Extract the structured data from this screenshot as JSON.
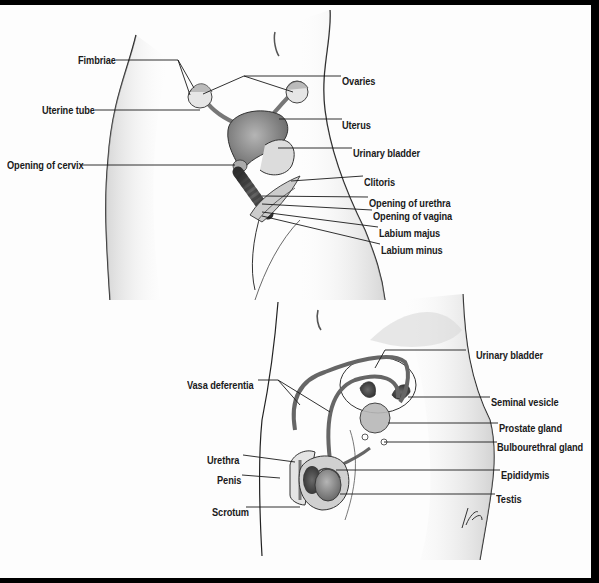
{
  "diagram": {
    "type": "anatomical-illustration",
    "panels": [
      {
        "id": "female",
        "labels": [
          {
            "text": "Fimbriae",
            "side": "left"
          },
          {
            "text": "Uterine tube",
            "side": "left"
          },
          {
            "text": "Opening of cervix",
            "side": "left"
          },
          {
            "text": "Ovaries",
            "side": "right"
          },
          {
            "text": "Uterus",
            "side": "right"
          },
          {
            "text": "Urinary bladder",
            "side": "right"
          },
          {
            "text": "Clitoris",
            "side": "right"
          },
          {
            "text": "Opening of urethra",
            "side": "right"
          },
          {
            "text": "Opening of vagina",
            "side": "right"
          },
          {
            "text": "Labium majus",
            "side": "right"
          },
          {
            "text": "Labium minus",
            "side": "right"
          }
        ]
      },
      {
        "id": "male",
        "labels": [
          {
            "text": "Vasa deferentia",
            "side": "left"
          },
          {
            "text": "Urethra",
            "side": "left"
          },
          {
            "text": "Penis",
            "side": "left"
          },
          {
            "text": "Scrotum",
            "side": "left"
          },
          {
            "text": "Urinary bladder",
            "side": "right"
          },
          {
            "text": "Seminal vesicle",
            "side": "right"
          },
          {
            "text": "Prostate gland",
            "side": "right"
          },
          {
            "text": "Bulbourethral gland",
            "side": "right"
          },
          {
            "text": "Epididymis",
            "side": "right"
          },
          {
            "text": "Testis",
            "side": "right"
          }
        ]
      }
    ]
  },
  "colors": {
    "frame": "#000000",
    "background": "#fdfdfd",
    "ink": "#1a1a1a",
    "organ_fill": "#8a8a8a",
    "organ_dark": "#4a4a4a",
    "skin_shade": "#c8c8c8"
  }
}
